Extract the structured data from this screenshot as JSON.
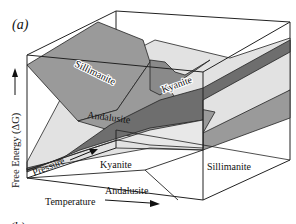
{
  "figure": {
    "panel_a_label": "(a)",
    "panel_b_label": "(b)",
    "colors": {
      "sillimanite_surface": "#9a9a9a",
      "kyanite_surface": "#6e6e6e",
      "andalusite_surface": "#e2e2e2",
      "background": "#ffffff",
      "lines": "#222222"
    }
  },
  "axes": {
    "y_label": "Free Energy (ΔG)",
    "pressure_label": "Pressure",
    "temperature_label": "Temperature"
  },
  "surfaces": {
    "sillimanite": "Sillimanite",
    "kyanite": "Kyanite",
    "andalusite": "Andalusite"
  },
  "base_fields": {
    "kyanite": "Kyanite",
    "andalusite": "Andalusite",
    "sillimanite": "Sillimanite"
  }
}
